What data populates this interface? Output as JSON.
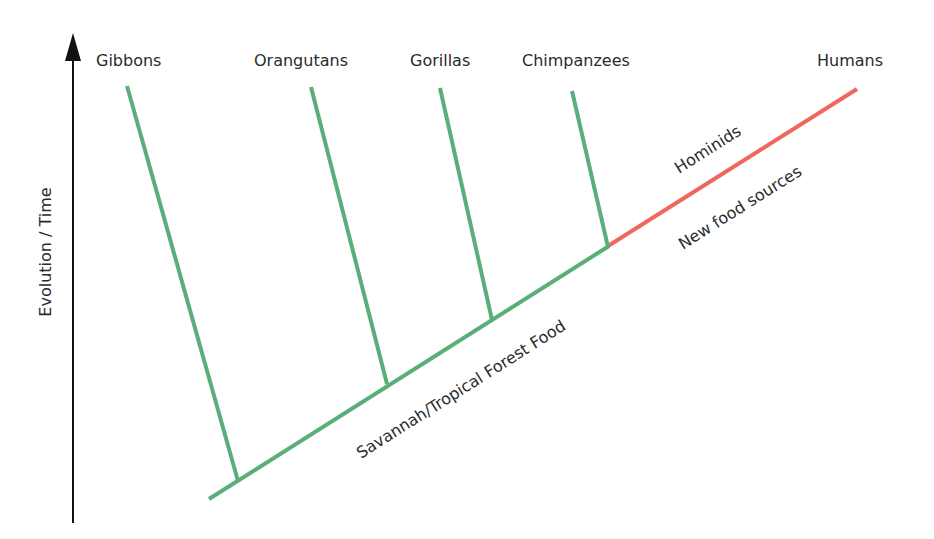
{
  "diagram": {
    "type": "phylogenetic-tree",
    "axis": {
      "label": "Evolution / Time",
      "direction": "up",
      "color": "#111111"
    },
    "colors": {
      "ancestral_branch": "#5aae7a",
      "hominid_branch": "#f0675e",
      "text": "#2b2b2b"
    },
    "taxa": [
      {
        "name": "Gibbons",
        "branch_color": "#5aae7a"
      },
      {
        "name": "Orangutans",
        "branch_color": "#5aae7a"
      },
      {
        "name": "Gorillas",
        "branch_color": "#5aae7a"
      },
      {
        "name": "Chimpanzees",
        "branch_color": "#5aae7a"
      },
      {
        "name": "Humans",
        "branch_color": "#f0675e"
      }
    ],
    "annotations": {
      "trunk_label": "Savannah/Tropical Forest Food",
      "hominid_label": "Hominids",
      "hominid_sublabel": "New food sources"
    }
  }
}
